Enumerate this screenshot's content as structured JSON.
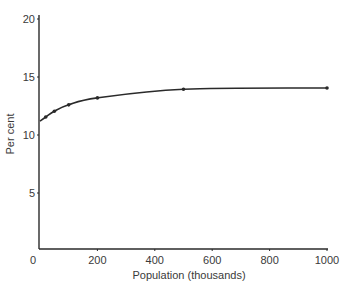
{
  "chart_data": {
    "type": "line",
    "title": "",
    "xlabel": "Population (thousands)",
    "ylabel": "Per cent",
    "xlim": [
      0,
      1000
    ],
    "ylim": [
      0,
      20
    ],
    "xticks": [
      0,
      200,
      400,
      600,
      800,
      1000
    ],
    "yticks": [
      5,
      10,
      15,
      20
    ],
    "grid": false,
    "legend": null,
    "series": [
      {
        "name": "Per cent",
        "x": [
          0,
          20,
          50,
          100,
          200,
          500,
          1000
        ],
        "y": [
          11.2,
          11.55,
          12.05,
          12.6,
          13.2,
          13.95,
          14.05
        ],
        "markers": [
          20,
          50,
          100,
          200,
          500,
          1000
        ]
      }
    ]
  },
  "colors": {
    "line": "#2a2a2a",
    "axis": "#2a2a2a",
    "text": "#3a3a3a"
  }
}
